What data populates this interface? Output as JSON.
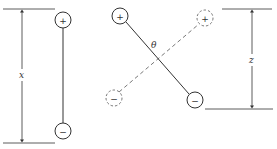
{
  "diagram": {
    "colors": {
      "stroke": "#333333",
      "dashed": "#555555",
      "background": "#ffffff"
    },
    "left_dipole": {
      "positive_sign": "+",
      "negative_sign": "−",
      "distance_label": "x"
    },
    "rotated_dipole": {
      "solid": {
        "positive_sign": "+",
        "negative_sign": "−"
      },
      "dashed": {
        "positive_sign": "+",
        "negative_sign": "−"
      },
      "angle_label": "θ"
    },
    "right_dimension": {
      "distance_label": "z"
    }
  }
}
